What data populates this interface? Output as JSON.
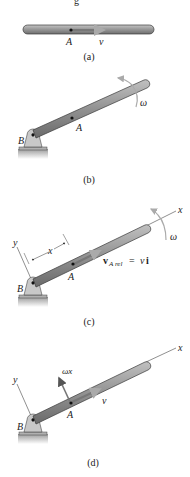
{
  "figure": {
    "top_fragment": "g",
    "panels": [
      {
        "id": "a",
        "caption": "(a)",
        "labels": {
          "point": "A",
          "velocity": "v"
        }
      },
      {
        "id": "b",
        "caption": "(b)",
        "labels": {
          "point": "A",
          "pivot": "B",
          "angular_velocity": "ω"
        }
      },
      {
        "id": "c",
        "caption": "(c)",
        "labels": {
          "point": "A",
          "pivot": "B",
          "angular_velocity": "ω",
          "x_axis": "x",
          "y_axis": "y",
          "distance": "x",
          "rel_velocity_v": "v",
          "rel_velocity_sub": "A rel",
          "rel_velocity_eq": " = ",
          "rel_velocity_rhs_v": "v",
          "rel_velocity_rhs_i": "i"
        }
      },
      {
        "id": "d",
        "caption": "(d)",
        "labels": {
          "point": "A",
          "pivot": "B",
          "x_axis": "x",
          "y_axis": "y",
          "velocity": "v",
          "transverse_velocity": "ωx"
        }
      }
    ],
    "colors": {
      "bar_fill": "#8c8c8c",
      "bar_highlight": "#b5b5b5",
      "bar_edge": "#3a3a3a",
      "support_fill": "#c8c8c8",
      "ground": "#9a9a9a",
      "arrow_light": "#a8a8a8",
      "text": "#222222"
    }
  }
}
